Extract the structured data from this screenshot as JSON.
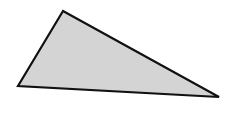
{
  "figure": {
    "shape": "triangle",
    "vertices": [
      [
        63,
        11
      ],
      [
        18,
        86
      ],
      [
        219,
        97
      ]
    ],
    "fill_color": "#d4d4d4",
    "stroke_color": "#111111",
    "stroke_width": 2.2
  }
}
